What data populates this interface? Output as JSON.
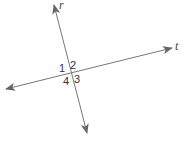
{
  "diagram": {
    "lines": [
      {
        "name": "r",
        "label": "r",
        "x1": 54,
        "y1": 5,
        "x2": 87,
        "y2": 133
      },
      {
        "name": "t",
        "label": "t",
        "x1": 6,
        "y1": 89,
        "x2": 172,
        "y2": 48
      }
    ],
    "angles": [
      {
        "label": "1"
      },
      {
        "label": "2"
      },
      {
        "label": "3"
      },
      {
        "label": "4"
      }
    ],
    "line_color": "#777777",
    "arrow_color": "#666666"
  }
}
